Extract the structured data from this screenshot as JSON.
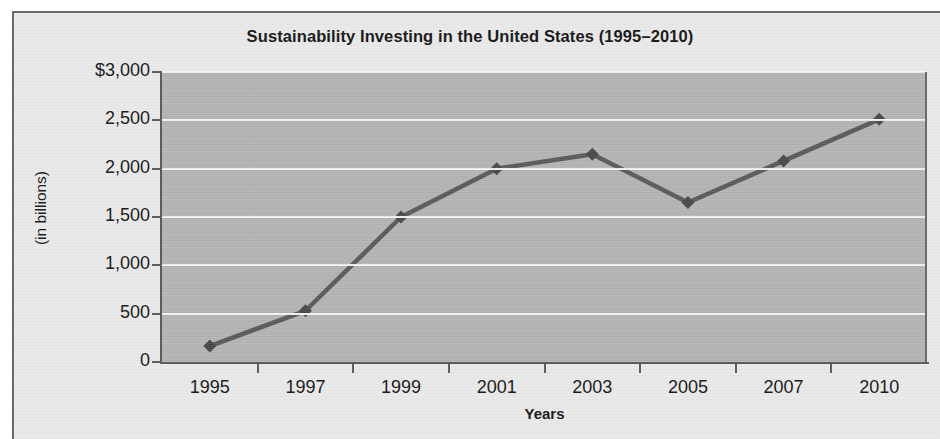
{
  "chart_data": {
    "type": "line",
    "title": "Sustainability Investing in the United States (1995–2010)",
    "xlabel": "Years",
    "ylabel": "(in billions)",
    "categories": [
      "1995",
      "1997",
      "1999",
      "2001",
      "2003",
      "2005",
      "2007",
      "2010"
    ],
    "values": [
      165,
      530,
      1500,
      2000,
      2150,
      1650,
      2080,
      2510
    ],
    "series": [
      {
        "name": "Sustainability investing assets",
        "values": [
          165,
          530,
          1500,
          2000,
          2150,
          1650,
          2080,
          2510
        ]
      }
    ],
    "ylim": [
      0,
      3000
    ],
    "yticks": [
      0,
      500,
      1000,
      1500,
      2000,
      2500,
      3000
    ],
    "ytick_labels": [
      "0",
      "500",
      "1,000",
      "1,500",
      "2,000",
      "2,500",
      "$3,000"
    ],
    "grid": true,
    "legend": "none",
    "marker": "diamond",
    "colors": {
      "line": "#5c5c5c",
      "marker": "#4a4a4a",
      "plot_background": "#b6b6b6",
      "gridline": "#f4f4f4",
      "figure_background": "#e9e9e9",
      "axis": "#5e5e5e",
      "text": "#1d1d1d"
    }
  }
}
